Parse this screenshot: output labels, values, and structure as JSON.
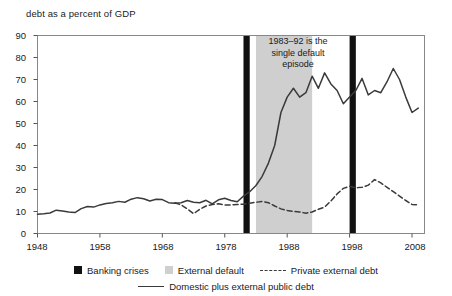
{
  "chart_data": {
    "type": "line",
    "title": "debt as a percent of GDP",
    "xlabel": "",
    "ylabel": "debt as a percent of GDP",
    "xlim": [
      1948,
      2010
    ],
    "ylim": [
      0,
      90
    ],
    "ytick_labels": [
      "90",
      "80",
      "70",
      "60",
      "50",
      "40",
      "30",
      "20",
      "10",
      "0"
    ],
    "ytick_values": [
      90,
      80,
      70,
      60,
      50,
      40,
      30,
      20,
      10,
      0
    ],
    "xtick_labels": [
      "1948",
      "1958",
      "1968",
      "1978",
      "1988",
      "1998",
      "2008"
    ],
    "xtick_values": [
      1948,
      1958,
      1968,
      1978,
      1988,
      1998,
      2008
    ],
    "grid": false,
    "legend_position": "bottom",
    "annotations": [
      {
        "text": "1983–92 is the single default episode",
        "x": 1986,
        "y": 84
      }
    ],
    "shaded_bands": [
      {
        "name": "External default",
        "color": "#cfcfcf",
        "x_start": 1983,
        "x_end": 1992
      }
    ],
    "vertical_markers": [
      {
        "name": "Banking crises",
        "color": "#111111",
        "x_start": 1981,
        "x_end": 1982
      },
      {
        "name": "Banking crises",
        "color": "#111111",
        "x_start": 1998,
        "x_end": 1999
      }
    ],
    "series": [
      {
        "name": "Domestic plus external public debt",
        "style": "solid",
        "color": "#3a3a3a",
        "x": [
          1948,
          1949,
          1950,
          1951,
          1952,
          1953,
          1954,
          1955,
          1956,
          1957,
          1958,
          1959,
          1960,
          1961,
          1962,
          1963,
          1964,
          1965,
          1966,
          1967,
          1968,
          1969,
          1970,
          1971,
          1972,
          1973,
          1974,
          1975,
          1976,
          1977,
          1978,
          1979,
          1980,
          1981,
          1982,
          1983,
          1984,
          1985,
          1986,
          1987,
          1988,
          1989,
          1990,
          1991,
          1992,
          1993,
          1994,
          1995,
          1996,
          1997,
          1998,
          1999,
          2000,
          2001,
          2002,
          2003,
          2004,
          2005,
          2006,
          2007,
          2008,
          2009
        ],
        "values": [
          8.8,
          9.0,
          9.3,
          10.6,
          10.2,
          9.8,
          9.5,
          11.3,
          12.3,
          12.0,
          13.0,
          13.6,
          14.0,
          14.6,
          14.2,
          15.6,
          16.3,
          15.8,
          14.8,
          15.6,
          15.4,
          14.0,
          13.8,
          14.0,
          15.0,
          14.2,
          14.0,
          15.1,
          13.5,
          15.3,
          16.0,
          15.0,
          14.4,
          17.0,
          19.0,
          21.8,
          26.0,
          32.0,
          40.0,
          55.0,
          62.0,
          66.0,
          62.0,
          64.0,
          71.5,
          66.0,
          73.0,
          68.0,
          65.0,
          59.0,
          62.0,
          65.0,
          70.5,
          63.0,
          65.0,
          64.0,
          69.0,
          75.0,
          70.0,
          62.0,
          55.0,
          57.0
        ]
      },
      {
        "name": "Private external debt",
        "style": "dashed",
        "color": "#3a3a3a",
        "x": [
          1970,
          1971,
          1972,
          1973,
          1974,
          1975,
          1976,
          1977,
          1978,
          1979,
          1980,
          1981,
          1982,
          1983,
          1984,
          1985,
          1986,
          1987,
          1988,
          1989,
          1990,
          1991,
          1992,
          1993,
          1994,
          1995,
          1996,
          1997,
          1998,
          1999,
          2000,
          2001,
          2002,
          2003,
          2004,
          2005,
          2006,
          2007,
          2008,
          2009
        ],
        "values": [
          14.0,
          13.0,
          11.2,
          9.0,
          11.0,
          12.5,
          13.2,
          13.5,
          13.0,
          13.0,
          13.2,
          13.3,
          13.8,
          14.2,
          14.6,
          14.0,
          12.5,
          11.2,
          10.5,
          10.0,
          9.8,
          9.2,
          9.8,
          11.0,
          12.0,
          14.8,
          18.0,
          20.5,
          21.5,
          20.8,
          21.0,
          22.0,
          24.5,
          23.0,
          21.0,
          19.0,
          17.0,
          15.0,
          13.2,
          13.0
        ]
      }
    ],
    "legend": [
      {
        "label": "Banking crises",
        "marker": "black-square"
      },
      {
        "label": "External default",
        "marker": "gray-square"
      },
      {
        "label": "Private external debt",
        "marker": "dashed-line"
      },
      {
        "label": "Domestic plus external public debt",
        "marker": "solid-line"
      }
    ]
  }
}
